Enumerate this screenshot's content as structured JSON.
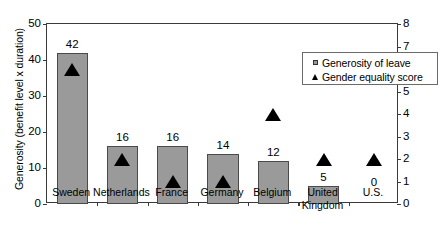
{
  "chart_data": {
    "type": "bar",
    "title": "",
    "categories": [
      "Sweden",
      "Netherlands",
      "France",
      "Germany",
      "Belgium",
      "United\nKingdom",
      "U.S."
    ],
    "series": [
      {
        "name": "Generosity of leave",
        "type": "bar",
        "axis": "left",
        "values": [
          42,
          16,
          16,
          14,
          12,
          5,
          0
        ],
        "value_labels": [
          "42",
          "16",
          "16",
          "14",
          "12",
          "5",
          "0"
        ],
        "color": "#9a9a9a"
      },
      {
        "name": "Gender equality score",
        "type": "marker",
        "marker": "triangle",
        "axis": "right",
        "values": [
          6.0,
          2.0,
          1.0,
          1.0,
          4.0,
          2.0,
          2.0
        ],
        "color": "#000000"
      }
    ],
    "xlabel": "",
    "ylabel": "Generosity (benefit level x duration)",
    "ylabel_right": "Gender equality",
    "ylim": [
      0,
      50
    ],
    "yticks": [
      0,
      10,
      20,
      30,
      40,
      50
    ],
    "ylim_right": [
      0,
      8
    ],
    "yticks_right": [
      0,
      1,
      2,
      3,
      4,
      5,
      6,
      7,
      8
    ],
    "grid": false,
    "legend_position": "top-right",
    "legend_entries": [
      "Generosity of leave",
      "Gender equality score"
    ]
  },
  "axes": {
    "left_title": "Generosity (benefit level x duration)",
    "right_title": "Gender equality",
    "left_ticks": [
      "0",
      "10",
      "20",
      "30",
      "40",
      "50"
    ],
    "right_ticks": [
      "0",
      "1",
      "2",
      "3",
      "4",
      "5",
      "6",
      "7",
      "8"
    ]
  },
  "legend": {
    "items": [
      {
        "label": "Generosity of leave",
        "key": "square-marker"
      },
      {
        "label": "Gender equality score",
        "key": "triangle-marker"
      }
    ]
  }
}
